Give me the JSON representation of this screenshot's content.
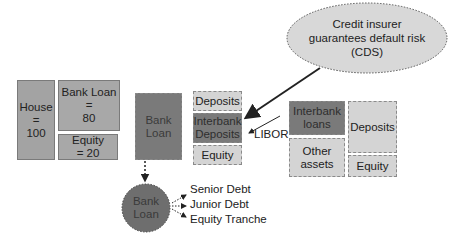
{
  "callout": {
    "text": "Credit insurer\nguarantees default risk\n(CDS)"
  },
  "homeowner": {
    "house": "House\n=\n100",
    "bank_loan": "Bank Loan\n=\n80",
    "equity": "Equity\n= 20"
  },
  "bank_asset": {
    "label": "Bank\nLoan"
  },
  "bank_liabilities": {
    "deposits": "Deposits",
    "interbank_deposits": "Interbank\nDeposits",
    "equity": "Equity"
  },
  "libor_label": "LIBOR",
  "other_bank": {
    "interbank_loans": "Interbank\nloans",
    "other_assets": "Other\nassets",
    "deposits": "Deposits",
    "equity": "Equity"
  },
  "securitization": {
    "circle_label": "Bank\nLoan",
    "tranches": [
      "Senior Debt",
      "Junior Debt",
      "Equity Tranche"
    ]
  },
  "colors": {
    "dark": "#7a7a7a",
    "mid": "#a8a8a8",
    "light": "#d4d4d4",
    "border": "#8a8a8a"
  }
}
